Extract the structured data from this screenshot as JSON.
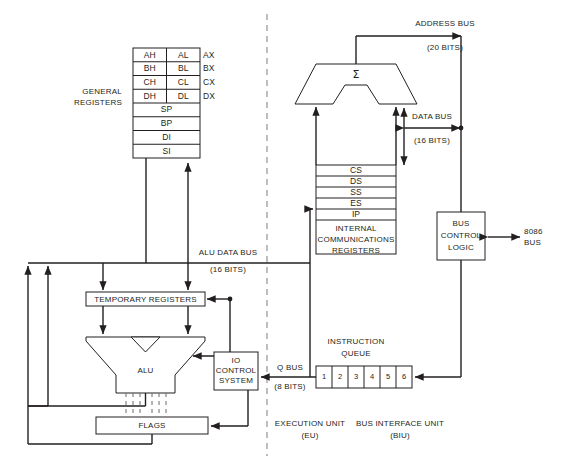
{
  "diagram": {
    "colors": {
      "line": "#231f20",
      "dashed": "#6d6a6b",
      "background": "#ffffff"
    }
  },
  "general_registers": {
    "label_line1": "GENERAL",
    "label_line2": "REGISTERS",
    "paired_rows": [
      {
        "high": "AH",
        "low": "AL",
        "name": "AX"
      },
      {
        "high": "BH",
        "low": "BL",
        "name": "BX"
      },
      {
        "high": "CH",
        "low": "CL",
        "name": "CX"
      },
      {
        "high": "DH",
        "low": "DL",
        "name": "DX"
      }
    ],
    "single_rows": [
      "SP",
      "BP",
      "DI",
      "SI"
    ]
  },
  "execution_unit": {
    "temporary_registers": "TEMPORARY REGISTERS",
    "alu": "ALU",
    "flags": "FLAGS",
    "unit_label_line1": "EXECUTION UNIT",
    "unit_label_line2": "(EU)"
  },
  "io_control": {
    "line1": "IO",
    "line2": "CONTROL",
    "line3": "SYSTEM"
  },
  "alu_data_bus": {
    "label": "ALU DATA BUS",
    "width": "(16 BITS)"
  },
  "q_bus": {
    "label": "Q BUS",
    "width": "(8 BITS)"
  },
  "bus_interface_unit": {
    "adder_symbol": "Σ",
    "unit_label_line1": "BUS INTERFACE UNIT",
    "unit_label_line2": "(BIU)"
  },
  "internal_communications_registers": {
    "rows": [
      "CS",
      "DS",
      "SS",
      "ES",
      "IP"
    ],
    "label_line1": "INTERNAL",
    "label_line2": "COMMUNICATIONS",
    "label_line3": "REGISTERS"
  },
  "bus_control_logic": {
    "line1": "BUS",
    "line2": "CONTROL",
    "line3": "LOGIC"
  },
  "external_bus": {
    "line1": "8086",
    "line2": "BUS"
  },
  "address_bus": {
    "label": "ADDRESS BUS",
    "width": "(20 BITS)"
  },
  "data_bus": {
    "label": "DATA BUS",
    "width": "(16 BITS)"
  },
  "instruction_queue": {
    "label_line1": "INSTRUCTION",
    "label_line2": "QUEUE",
    "cells": [
      "1",
      "2",
      "3",
      "4",
      "5",
      "6"
    ]
  }
}
